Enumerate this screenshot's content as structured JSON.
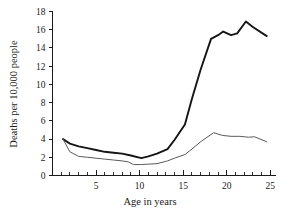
{
  "chart_data": {
    "type": "line",
    "title": "",
    "xlabel": "Age in years",
    "ylabel": "Deaths per 10,000 people",
    "xlim": [
      0,
      25.6
    ],
    "ylim": [
      0,
      18
    ],
    "grid": false,
    "legend": "none",
    "x_ticks_major": [
      5,
      10,
      15,
      20,
      25
    ],
    "x_ticks_major_labels": [
      "5",
      "10",
      "15",
      "20",
      "25"
    ],
    "x_ticks_minor": [
      1,
      2,
      3,
      4,
      6,
      7,
      8,
      9,
      11,
      12,
      13,
      14,
      16,
      17,
      18,
      19,
      21,
      22,
      23,
      24
    ],
    "y_ticks": [
      0,
      2,
      4,
      6,
      8,
      10,
      12,
      14,
      16,
      18
    ],
    "y_tick_labels": [
      "0",
      "2",
      "4",
      "6",
      "8",
      "10",
      "12",
      "14",
      "16",
      "18"
    ],
    "series": [
      {
        "name": "upper-curve",
        "color": "#151515",
        "linewidth": 1.9,
        "x": [
          1.2,
          2.0,
          3.0,
          4.0,
          5.0,
          6.0,
          7.0,
          8.0,
          9.0,
          10.2,
          11.0,
          12.0,
          13.2,
          14.0,
          15.2,
          16.0,
          17.0,
          18.2,
          19.0,
          19.6,
          20.5,
          21.2,
          22.2,
          23.0,
          24.6
        ],
        "y": [
          4.0,
          3.5,
          3.2,
          3.0,
          2.8,
          2.6,
          2.5,
          2.4,
          2.2,
          1.9,
          2.1,
          2.4,
          2.9,
          3.9,
          5.6,
          8.4,
          11.6,
          15.0,
          15.4,
          15.8,
          15.4,
          15.6,
          16.9,
          16.3,
          15.3
        ]
      },
      {
        "name": "lower-curve",
        "color": "#5a5a5a",
        "linewidth": 1.0,
        "x": [
          1.2,
          2.0,
          3.0,
          4.0,
          5.0,
          6.0,
          7.0,
          8.0,
          8.7,
          9.3,
          10.2,
          11.0,
          12.0,
          13.2,
          14.0,
          15.2,
          16.0,
          17.0,
          18.5,
          19.5,
          20.5,
          21.5,
          22.5,
          23.2,
          24.6
        ],
        "y": [
          4.0,
          2.6,
          2.1,
          2.0,
          1.9,
          1.8,
          1.7,
          1.6,
          1.5,
          1.2,
          1.2,
          1.25,
          1.3,
          1.6,
          1.9,
          2.3,
          2.9,
          3.7,
          4.7,
          4.4,
          4.3,
          4.3,
          4.2,
          4.25,
          3.7
        ]
      }
    ]
  },
  "axes": {
    "y_label": "Deaths per 10,000 people",
    "x_label": "Age in years"
  }
}
